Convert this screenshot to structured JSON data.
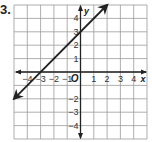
{
  "problem": {
    "number": "3."
  },
  "chart_data": {
    "type": "line",
    "title": "",
    "xlabel": "x",
    "ylabel": "y",
    "xlim": [
      -5,
      5
    ],
    "ylim": [
      -5,
      5
    ],
    "grid": true,
    "x_ticks": [
      "-4",
      "-3",
      "-2",
      "-1",
      "1",
      "2",
      "3",
      "4"
    ],
    "y_ticks": [
      "4",
      "3",
      "2",
      "1",
      "-2",
      "-3",
      "-4"
    ],
    "origin_label": "O",
    "series": [
      {
        "name": "line",
        "equation": "y = x + 3",
        "slope": 1,
        "intercept": 3,
        "x": [
          -5,
          2
        ],
        "y": [
          -2,
          5
        ],
        "arrows": "both",
        "color": "#222222"
      }
    ]
  }
}
